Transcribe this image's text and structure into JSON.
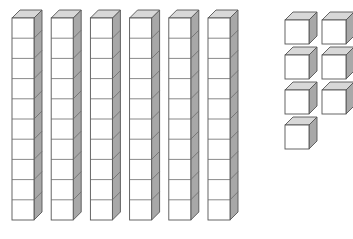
{
  "scene": {
    "title": "Base Ten Blocks",
    "description": "Base-ten block representation of a number",
    "background_color": "#ffffff",
    "width": 353,
    "height": 239
  },
  "colors": {
    "front_face": "#ffffff",
    "top_face": "#d8d8d8",
    "side_face": "#a8a8a8",
    "outline": "#555555",
    "inner_line": "#6b6b6b"
  },
  "geometry": {
    "unit_width": 22,
    "unit_height": 20.2,
    "depth_x": 8,
    "depth_y": 8,
    "rod_top_y": 18,
    "rod_left_x": 12,
    "rod_spacing_x": 39.2,
    "cube_size": 24,
    "cube_col_x": [
      285,
      322
    ],
    "cube_row_y": [
      20,
      55,
      90,
      125
    ]
  },
  "chart_data": {
    "type": "table",
    "categories": [
      "tens (rods)",
      "ones (unit cubes)"
    ],
    "values": [
      6,
      7
    ],
    "units_per_rod": 10,
    "tens_count": 6,
    "ones_count": 7,
    "total_value": 67,
    "xlabel": "place value",
    "ylabel": "count"
  },
  "groups": {
    "tens": {
      "name": "tens-group",
      "label": "Tens rods",
      "count": 6,
      "units_each": 10,
      "rods": [
        {
          "index": 1,
          "units": 10,
          "x": 12
        },
        {
          "index": 2,
          "units": 10,
          "x": 51.2
        },
        {
          "index": 3,
          "units": 10,
          "x": 90.4
        },
        {
          "index": 4,
          "units": 10,
          "x": 129.6
        },
        {
          "index": 5,
          "units": 10,
          "x": 168.8
        },
        {
          "index": 6,
          "units": 10,
          "x": 208
        }
      ]
    },
    "ones": {
      "name": "ones-group",
      "label": "Unit cubes",
      "count": 7,
      "cubes": [
        {
          "index": 1,
          "x": 285,
          "y": 20
        },
        {
          "index": 2,
          "x": 322,
          "y": 20
        },
        {
          "index": 3,
          "x": 285,
          "y": 55
        },
        {
          "index": 4,
          "x": 322,
          "y": 55
        },
        {
          "index": 5,
          "x": 285,
          "y": 90
        },
        {
          "index": 6,
          "x": 322,
          "y": 90
        },
        {
          "index": 7,
          "x": 285,
          "y": 125
        }
      ]
    }
  }
}
